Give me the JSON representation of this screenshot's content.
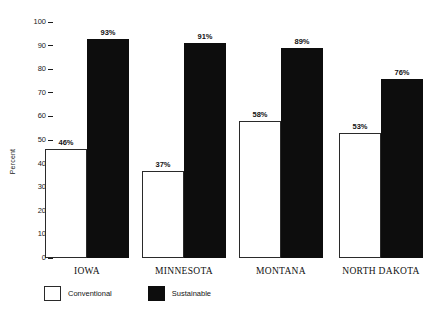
{
  "chart_data": {
    "type": "bar",
    "title": "",
    "subtitle": "",
    "xlabel": "",
    "ylabel": "Percent",
    "ylim": [
      0,
      100
    ],
    "ytick_step": 10,
    "yticks": [
      "0",
      "10",
      "20",
      "30",
      "40",
      "50",
      "60",
      "70",
      "80",
      "90",
      "100"
    ],
    "grid": false,
    "legend_position": "bottom-left",
    "categories": [
      "IOWA",
      "MINNESOTA",
      "MONTANA",
      "NORTH DAKOTA"
    ],
    "series": [
      {
        "name": "Conventional",
        "color": "#ffffff",
        "edge_color": "#2a2a2a",
        "values": [
          46,
          37,
          58,
          53
        ],
        "labels": [
          "46%",
          "37%",
          "58%",
          "53%"
        ]
      },
      {
        "name": "Sustainable",
        "color": "#0d0d0d",
        "edge_color": "#0d0d0d",
        "values": [
          93,
          91,
          89,
          76
        ],
        "labels": [
          "93%",
          "91%",
          "89%",
          "76%"
        ]
      }
    ]
  },
  "legend": {
    "items": [
      {
        "label": "Conventional",
        "swatch": "conventional"
      },
      {
        "label": "Sustainable",
        "swatch": "sustainable"
      }
    ]
  },
  "colors": {
    "background": "#ffffff",
    "ink": "#111111",
    "bar_fill_sustainable": "#0d0d0d",
    "bar_fill_conventional": "#ffffff"
  }
}
